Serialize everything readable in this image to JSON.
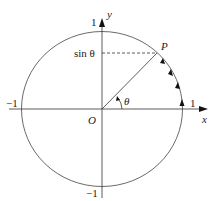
{
  "diagram": {
    "labels": {
      "y_axis": "y",
      "x_axis": "x",
      "origin": "O",
      "point": "P",
      "angle": "θ",
      "sin_label": "sin θ",
      "x_pos_one": "1",
      "x_neg_one": "−1",
      "y_pos_one": "1",
      "y_neg_one": "−1"
    }
  }
}
